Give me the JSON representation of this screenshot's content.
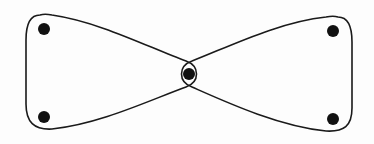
{
  "diagram": {
    "type": "hypergraph",
    "stroke_color": "#1a1a1a",
    "vertex_color": "#111111",
    "vertices": [
      {
        "id": "v1",
        "x": 44,
        "y": 29
      },
      {
        "id": "v2",
        "x": 44,
        "y": 117
      },
      {
        "id": "v3",
        "x": 189,
        "y": 74
      },
      {
        "id": "v4",
        "x": 333,
        "y": 31
      },
      {
        "id": "v5",
        "x": 333,
        "y": 119
      }
    ],
    "hyperedges": [
      {
        "id": "e-left",
        "vertices": [
          "v1",
          "v2",
          "v3"
        ]
      },
      {
        "id": "e-right",
        "vertices": [
          "v3",
          "v4",
          "v5"
        ]
      }
    ]
  }
}
